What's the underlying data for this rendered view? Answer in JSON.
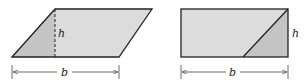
{
  "figures": [
    {
      "name": "parallelogram",
      "height_label": "h",
      "base_label": "b",
      "fill_light": "#dcdcdc",
      "fill_dark": "#c4c4c4"
    },
    {
      "name": "rectangle",
      "height_label": "h",
      "base_label": "b",
      "fill_light": "#dcdcdc",
      "fill_dark": "#c4c4c4"
    }
  ]
}
